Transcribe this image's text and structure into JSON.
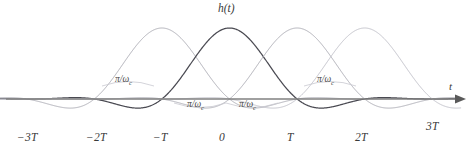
{
  "figure": {
    "title": "h(t)",
    "axis_label_x": "t",
    "axis_label_y": "h(t)",
    "background": "#ffffff",
    "axis_color": "#808080",
    "dark_curve_color": "#4a4a52",
    "light_curve_color": "#b0b0b8",
    "arrow": "right-arrow"
  },
  "ticks": [
    {
      "label": "−3T",
      "x": 28
    },
    {
      "label": "−2T",
      "x": 97
    },
    {
      "label": "−T",
      "x": 164
    },
    {
      "label": "0",
      "x": 230
    },
    {
      "label": "T",
      "x": 298
    },
    {
      "label": "2T",
      "x": 366
    },
    {
      "label": "3T",
      "x": 437
    }
  ],
  "annotations": [
    {
      "text": "π/ω",
      "sub": "c",
      "x": 128,
      "y": 80
    },
    {
      "text": "π/ω",
      "sub": "c",
      "x": 200,
      "y": 105
    },
    {
      "text": "π/ω",
      "sub": "c",
      "x": 252,
      "y": 105
    },
    {
      "text": "π/ω",
      "sub": "c",
      "x": 330,
      "y": 80
    }
  ],
  "chart_data": {
    "type": "line",
    "title": "h(t)",
    "xlabel": "t",
    "ylabel": "h(t)",
    "grid": false,
    "legend": null,
    "xlim": [
      -3.35,
      3.45
    ],
    "ylim": [
      -0.38,
      1.08
    ],
    "xticks": [
      -3,
      -2,
      -1,
      0,
      1,
      2,
      3
    ],
    "xticklabels": [
      "−3T",
      "−2T",
      "−T",
      "0",
      "T",
      "2T",
      "3T"
    ],
    "series": [
      {
        "name": "h(t+T)",
        "center": -1,
        "color": "#b0b0b8",
        "peak": 1.0,
        "emphasis": "light"
      },
      {
        "name": "h(t)",
        "center": 0,
        "color": "#4a4a52",
        "peak": 1.0,
        "emphasis": "dark"
      },
      {
        "name": "h(t-T)",
        "center": 1,
        "color": "#b0b0b8",
        "peak": 1.0,
        "emphasis": "light"
      },
      {
        "name": "h(t-2T)",
        "center": 2,
        "color": "#c4c4cc",
        "peak": 1.0,
        "emphasis": "light"
      }
    ],
    "annotation_label": "π/ωc",
    "annotation_count": 4
  }
}
